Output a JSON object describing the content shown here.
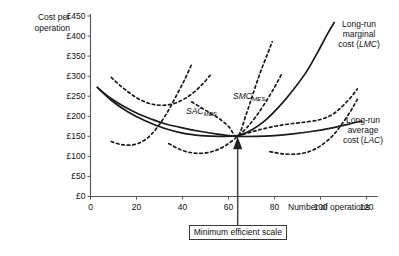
{
  "chart_data": {
    "type": "line",
    "title": "",
    "xlabel": "Number of operations",
    "ylabel": "Cost per operation",
    "xlim": [
      0,
      125
    ],
    "ylim": [
      0,
      450
    ],
    "grid": false,
    "legend_position": "inline-annotations",
    "currency": "£",
    "x_ticks": [
      "0",
      "20",
      "40",
      "60",
      "80",
      "100",
      "120"
    ],
    "x_tick_values": [
      0,
      20,
      40,
      60,
      80,
      100,
      120
    ],
    "y_ticks": [
      "£0",
      "£50",
      "£100",
      "£150",
      "£200",
      "£250",
      "£300",
      "£350",
      "£400",
      "£450"
    ],
    "y_tick_values": [
      0,
      50,
      100,
      150,
      200,
      250,
      300,
      350,
      400,
      450
    ],
    "minimum_efficient_scale": {
      "x": 64,
      "y": 150,
      "label": "Minimum efficient scale"
    },
    "series": [
      {
        "name": "Long-run average cost (LAC)",
        "style": "solid",
        "points": [
          [
            3,
            272
          ],
          [
            8,
            248
          ],
          [
            14,
            226
          ],
          [
            20,
            208
          ],
          [
            26,
            194
          ],
          [
            32,
            182
          ],
          [
            40,
            171
          ],
          [
            48,
            162
          ],
          [
            56,
            155
          ],
          [
            64,
            150
          ],
          [
            72,
            150
          ],
          [
            80,
            152
          ],
          [
            88,
            156
          ],
          [
            96,
            162
          ],
          [
            104,
            170
          ],
          [
            112,
            180
          ],
          [
            118,
            188
          ]
        ]
      },
      {
        "name": "Long-run marginal cost (LMC)",
        "style": "solid",
        "points": [
          [
            3,
            272
          ],
          [
            9,
            240
          ],
          [
            16,
            212
          ],
          [
            24,
            188
          ],
          [
            32,
            170
          ],
          [
            40,
            158
          ],
          [
            48,
            152
          ],
          [
            56,
            150
          ],
          [
            64,
            152
          ],
          [
            70,
            166
          ],
          [
            76,
            190
          ],
          [
            82,
            224
          ],
          [
            88,
            265
          ],
          [
            94,
            312
          ],
          [
            99,
            362
          ],
          [
            103,
            405
          ],
          [
            106,
            434
          ]
        ]
      },
      {
        "name": "SAC 1",
        "style": "dashed",
        "points": [
          [
            9,
            297
          ],
          [
            13,
            276
          ],
          [
            17,
            258
          ],
          [
            21,
            243
          ],
          [
            25,
            233
          ],
          [
            29,
            228
          ],
          [
            33,
            228
          ],
          [
            37,
            233
          ],
          [
            41,
            244
          ],
          [
            45,
            260
          ],
          [
            49,
            282
          ],
          [
            52,
            302
          ]
        ]
      },
      {
        "name": "SMC 1",
        "style": "dashed",
        "points": [
          [
            9,
            137
          ],
          [
            13,
            130
          ],
          [
            17,
            128
          ],
          [
            21,
            133
          ],
          [
            25,
            147
          ],
          [
            29,
            172
          ],
          [
            33,
            206
          ],
          [
            37,
            248
          ],
          [
            41,
            292
          ],
          [
            44,
            330
          ]
        ]
      },
      {
        "name": "SAC MES",
        "style": "dashed",
        "points": [
          [
            34,
            132
          ],
          [
            39,
            117
          ],
          [
            44,
            109
          ],
          [
            49,
            108
          ],
          [
            54,
            114
          ],
          [
            59,
            128
          ],
          [
            64,
            150
          ],
          [
            68,
            172
          ],
          [
            72,
            200
          ],
          [
            76,
            234
          ],
          [
            80,
            272
          ],
          [
            83,
            304
          ]
        ]
      },
      {
        "name": "SMC MES",
        "style": "dashed",
        "points": [
          [
            44,
            236
          ],
          [
            48,
            222
          ],
          [
            52,
            208
          ],
          [
            56,
            194
          ],
          [
            60,
            175
          ],
          [
            64,
            150
          ],
          [
            68,
            210
          ],
          [
            71,
            262
          ],
          [
            74,
            312
          ],
          [
            77,
            356
          ],
          [
            79,
            386
          ]
        ]
      },
      {
        "name": "SAC 3",
        "style": "dashed",
        "points": [
          [
            64,
            150
          ],
          [
            70,
            161
          ],
          [
            76,
            170
          ],
          [
            82,
            177
          ],
          [
            88,
            182
          ],
          [
            94,
            186
          ],
          [
            100,
            192
          ],
          [
            105,
            204
          ],
          [
            109,
            222
          ],
          [
            113,
            246
          ],
          [
            116,
            268
          ]
        ]
      },
      {
        "name": "SMC 3",
        "style": "dashed",
        "points": [
          [
            78,
            112
          ],
          [
            84,
            106
          ],
          [
            90,
            106
          ],
          [
            95,
            112
          ],
          [
            100,
            126
          ],
          [
            105,
            150
          ],
          [
            109,
            178
          ],
          [
            113,
            212
          ],
          [
            116,
            242
          ]
        ]
      }
    ],
    "annotations": [
      {
        "name": "lmc-label",
        "text_lines": [
          "Long-run",
          "marginal",
          "cost (LMC)"
        ],
        "italic_part": "LMC"
      },
      {
        "name": "lac-label",
        "text_lines": [
          "Long-run",
          "average",
          "cost (LAC)"
        ],
        "italic_part": "LAC"
      },
      {
        "name": "sac-mes-label",
        "text": "SAC",
        "subscript": "MES"
      },
      {
        "name": "smc-mes-label",
        "text": "SMC",
        "subscript": "MES"
      }
    ]
  },
  "axes": {
    "y_title_line1": "Cost per",
    "y_title_line2": "operation",
    "x_title": "Number of operations"
  },
  "labels": {
    "lmc_l1": "Long-run",
    "lmc_l2": "marginal",
    "lmc_l3a": "cost (",
    "lmc_l3b": "LMC",
    "lmc_l3c": ")",
    "lac_l1": "Long-run",
    "lac_l2": "average",
    "lac_l3a": "cost (",
    "lac_l3b": "LAC",
    "lac_l3c": ")",
    "sac_mes_main": "SAC",
    "sac_mes_sub": "MES",
    "smc_mes_main": "SMC",
    "smc_mes_sub": "MES",
    "mes_box": "Minimum efficient scale"
  },
  "ticks": {
    "y": [
      "£450",
      "£400",
      "£350",
      "£300",
      "£250",
      "£200",
      "£150",
      "£100",
      "£50",
      "£0"
    ],
    "x": [
      "0",
      "20",
      "40",
      "60",
      "80",
      "100",
      "120"
    ]
  },
  "colors": {
    "axis": "#555555",
    "curve": "#1a1a1a",
    "text": "#111111",
    "background": "#ffffff"
  }
}
